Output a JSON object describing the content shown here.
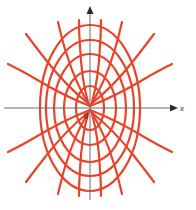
{
  "figure": {
    "title": "",
    "background_color": "#ffffff",
    "width": 196,
    "height": 210
  },
  "axes": {
    "x_label": "x",
    "y_label": "",
    "origin_label": "0",
    "axis_color": "#6b6b6b",
    "arrowhead_color": "#2b2b2b",
    "origin_px": {
      "x": 90,
      "y": 108
    },
    "x_axis_span_px": {
      "from": 4,
      "to": 176
    },
    "y_axis_span_px": {
      "from": 8,
      "to": 200
    },
    "x_arrow": true,
    "y_arrow": true
  },
  "chart_data": {
    "type": "line",
    "title": "",
    "subtitle": "",
    "xlabel": "x",
    "ylabel": "",
    "grid": false,
    "legend": null,
    "curve_color": "#e8442a",
    "curve_width": 2.2,
    "families": [
      {
        "name": "ellipses",
        "count": 5,
        "shared_center_px": {
          "x": 90,
          "y": 108
        },
        "members": [
          {
            "index": 1,
            "rx": 14,
            "ry": 22
          },
          {
            "index": 2,
            "rx": 26,
            "ry": 37
          },
          {
            "index": 3,
            "rx": 36,
            "ry": 54
          },
          {
            "index": 4,
            "rx": 44,
            "ry": 68
          },
          {
            "index": 5,
            "rx": 50,
            "ry": 83
          }
        ]
      },
      {
        "name": "hyperbolas",
        "count": 6,
        "note": "Three branch pairs opening left and three opening right, meeting at the common focus at the origin.",
        "members": [
          {
            "index": 1,
            "angle_deg": 18
          },
          {
            "index": 2,
            "angle_deg": 34
          },
          {
            "index": 3,
            "angle_deg": 52
          },
          {
            "index": 4,
            "angle_deg": 70
          },
          {
            "index": 5,
            "angle_deg": 86
          },
          {
            "index": 6,
            "angle_deg": 100
          }
        ]
      }
    ],
    "x_axis_crossings_right": [
      104,
      116,
      126,
      134,
      140
    ],
    "x_axis_crossings_left": [
      76,
      64,
      54,
      46,
      40
    ],
    "y_axis_crossings_up": [
      86,
      71,
      54,
      40,
      25
    ],
    "y_axis_crossings_down": [
      130,
      145,
      162,
      176,
      191
    ]
  }
}
